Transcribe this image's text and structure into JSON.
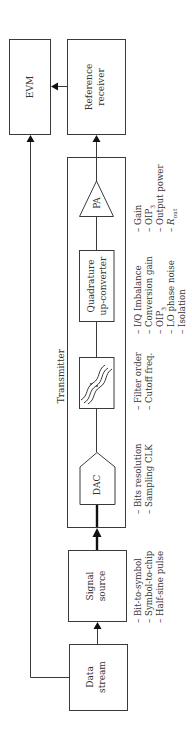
{
  "diagram": {
    "blocks": {
      "evm": {
        "label": "EVM"
      },
      "reference_receiver": {
        "line1": "Reference",
        "line2": "receiver"
      },
      "transmitter": {
        "label": "Transmitter"
      },
      "pa": {
        "label": "PA"
      },
      "quadrature": {
        "line1": "Quadrature",
        "line2": "up-converter"
      },
      "filter": {
        "label": ""
      },
      "dac": {
        "label": "DAC"
      },
      "signal_source": {
        "line1": "Signal",
        "line2": "source"
      },
      "data_stream": {
        "line1": "Data",
        "line2": "stream"
      }
    },
    "annotations": {
      "pa": {
        "items": [
          "– Gain",
          "– OIP",
          "– Output power",
          "– R"
        ],
        "subscripts": [
          "",
          "3",
          "",
          "out"
        ]
      },
      "quadrature": {
        "items": [
          "– I/Q Imbalance",
          "– Conversion gain",
          "– OIP",
          "– LO phase noise",
          "– Isolation"
        ],
        "subscripts": [
          "",
          "",
          "3",
          "",
          ""
        ]
      },
      "filter": {
        "items": [
          "– Filter order",
          "– Cutoff freq."
        ]
      },
      "dac": {
        "items": [
          "– Bits resolution",
          "– Sampling CLK"
        ]
      },
      "signal_source": {
        "items": [
          "– Bit-to-symbol",
          "– Symbol-to-chip",
          "– Half-sine pulse"
        ]
      }
    },
    "colors": {
      "stroke": "#3a3a3a",
      "text": "#333333",
      "background": "#ffffff"
    }
  }
}
